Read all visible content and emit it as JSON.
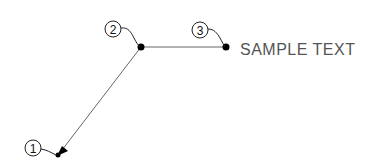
{
  "diagram": {
    "callouts": [
      {
        "id": "1",
        "label": "1",
        "cx": 33,
        "cy": 148,
        "target": [
          58,
          155
        ]
      },
      {
        "id": "2",
        "label": "2",
        "cx": 113,
        "cy": 29,
        "target": [
          141,
          47
        ]
      },
      {
        "id": "3",
        "label": "3",
        "cx": 200,
        "cy": 30,
        "target": [
          226,
          47
        ]
      }
    ],
    "leader_text": "SAMPLE TEXT",
    "colors": {
      "line": "#555555",
      "dot": "#000000",
      "text": "#555555"
    }
  }
}
